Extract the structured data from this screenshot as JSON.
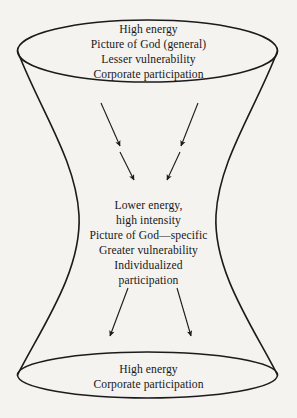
{
  "figure": {
    "background_color": "#f4f3f0",
    "stroke_color": "#1b1b1b",
    "text_color": "#181818",
    "shape": "hyperboloid-funnel"
  },
  "top_section": {
    "name": "top-ellipse-label",
    "lines": [
      "High energy",
      "Picture of God (general)",
      "Lesser vulnerability",
      "Corporate participation"
    ]
  },
  "middle_section": {
    "name": "waist-label",
    "lines": [
      "Lower energy,",
      "high intensity",
      "Picture of God—specific",
      "Greater vulnerability",
      "Individualized",
      "participation"
    ]
  },
  "bottom_section": {
    "name": "bottom-ellipse-label",
    "lines": [
      "High energy",
      "Corporate participation"
    ]
  },
  "arrows": {
    "upper": [
      {
        "name": "arrow-upper-left-outer",
        "x1": 101,
        "y1": 103,
        "x2": 120,
        "y2": 146,
        "direction": "down-right"
      },
      {
        "name": "arrow-upper-left-inner",
        "x1": 120,
        "y1": 152,
        "x2": 134,
        "y2": 180,
        "direction": "down-right"
      },
      {
        "name": "arrow-upper-right-outer",
        "x1": 198,
        "y1": 103,
        "x2": 181,
        "y2": 146,
        "direction": "down-left"
      },
      {
        "name": "arrow-upper-right-inner",
        "x1": 180,
        "y1": 152,
        "x2": 167,
        "y2": 180,
        "direction": "down-left"
      }
    ],
    "lower": [
      {
        "name": "arrow-lower-left",
        "x1": 128,
        "y1": 288,
        "x2": 110,
        "y2": 336,
        "direction": "down-left"
      },
      {
        "name": "arrow-lower-right",
        "x1": 177,
        "y1": 288,
        "x2": 191,
        "y2": 336,
        "direction": "down-right"
      }
    ]
  }
}
